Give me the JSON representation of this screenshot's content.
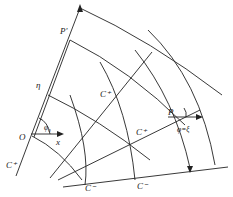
{
  "diagram": {
    "type": "characteristics-net",
    "stroke_color": "#222222",
    "background": "#ffffff",
    "labels": {
      "P_prime": "P'",
      "eta": "η",
      "origin": "O",
      "phi0": "φ₀",
      "x_axis": "x",
      "C_plus_left": "C⁺",
      "C_plus_mid": "C⁺",
      "C_plus_right": "C⁺",
      "C_minus_left": "C⁻",
      "C_minus_right": "C⁻",
      "P": "P",
      "phi_eq_xi": "φ=ξ"
    }
  }
}
